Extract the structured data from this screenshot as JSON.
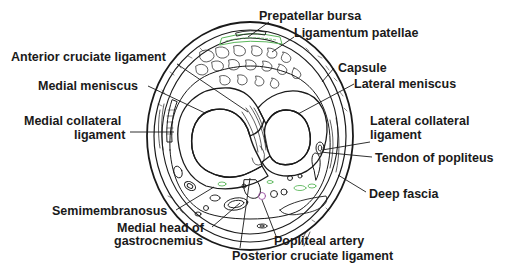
{
  "diagram": {
    "labels": {
      "prepatellar_bursa": "Prepatellar bursa",
      "ligamentum_patellae": "Ligamentum patellae",
      "anterior_cruciate_ligament": "Anterior cruciate ligament",
      "capsule": "Capsule",
      "medial_meniscus": "Medial meniscus",
      "lateral_meniscus": "Lateral meniscus",
      "medial_collateral_ligament_line1": "Medial collateral",
      "medial_collateral_ligament_line2": "ligament",
      "lateral_collateral_ligament_line1": "Lateral collateral",
      "lateral_collateral_ligament_line2": "ligament",
      "tendon_of_popliteus": "Tendon of popliteus",
      "deep_fascia": "Deep fascia",
      "semimembranosus": "Semimembranosus",
      "medial_head_gastrocnemius_line1": "Medial head of",
      "medial_head_gastrocnemius_line2": "gastrocnemius",
      "popliteal_artery": "Popliteal artery",
      "posterior_cruciate_ligament": "Posterior cruciate ligament"
    },
    "colors": {
      "ink": "#1a1a1a",
      "background": "#ffffff",
      "accent_green": "#5cb85c",
      "accent_purple": "#9b4fa3"
    }
  }
}
